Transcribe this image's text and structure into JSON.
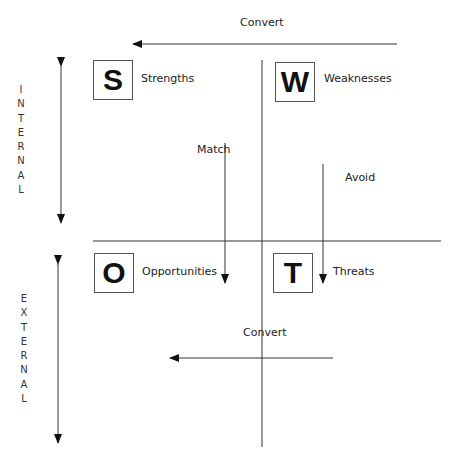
{
  "diagram": {
    "type": "SWOT matrix",
    "quadrants": [
      {
        "letter": "S",
        "label": "Strengths"
      },
      {
        "letter": "W",
        "label": "Weaknesses"
      },
      {
        "letter": "O",
        "label": "Opportunities"
      },
      {
        "letter": "T",
        "label": "Threats"
      }
    ],
    "axes": {
      "internal": {
        "letters": [
          "I",
          "N",
          "T",
          "E",
          "R",
          "N",
          "A",
          "L"
        ]
      },
      "external": {
        "letters": [
          "E",
          "X",
          "T",
          "E",
          "R",
          "N",
          "A",
          "L"
        ]
      }
    },
    "arrows": {
      "top_convert": "Convert",
      "bottom_convert": "Convert",
      "match": "Match",
      "avoid": "Avoid"
    },
    "colors": {
      "line": "#333333",
      "text": "#222222",
      "background": "#ffffff"
    }
  }
}
